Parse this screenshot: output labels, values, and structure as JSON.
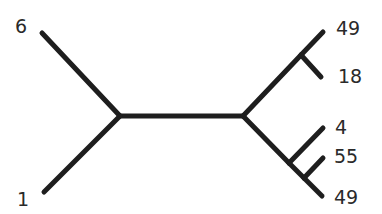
{
  "diagram": {
    "type": "unrooted-phylogenetic-tree",
    "line_color": "#1e1e1e",
    "label_color": "#2a2a2a",
    "internal_nodes": [
      "A",
      "B",
      "C",
      "D",
      "E"
    ],
    "edges": [
      {
        "id": "A-B",
        "from": "A",
        "to": "B"
      },
      {
        "id": "A-leaf6",
        "from": "A",
        "to": "leaf_6"
      },
      {
        "id": "A-leaf1",
        "from": "A",
        "to": "leaf_1"
      },
      {
        "id": "B-C",
        "from": "B",
        "to": "C"
      },
      {
        "id": "C-leaf49a",
        "from": "C",
        "to": "leaf_49_top"
      },
      {
        "id": "C-leaf18",
        "from": "C",
        "to": "leaf_18"
      },
      {
        "id": "B-D",
        "from": "B",
        "to": "D"
      },
      {
        "id": "D-leaf4",
        "from": "D",
        "to": "leaf_4"
      },
      {
        "id": "D-E",
        "from": "D",
        "to": "E"
      },
      {
        "id": "E-leaf55",
        "from": "E",
        "to": "leaf_55"
      },
      {
        "id": "E-leaf49b",
        "from": "E",
        "to": "leaf_49_bottom"
      }
    ],
    "leaves": {
      "leaf_6": "6",
      "leaf_1": "1",
      "leaf_49_top": "49",
      "leaf_18": "18",
      "leaf_4": "4",
      "leaf_55": "55",
      "leaf_49_bottom": "49"
    }
  }
}
